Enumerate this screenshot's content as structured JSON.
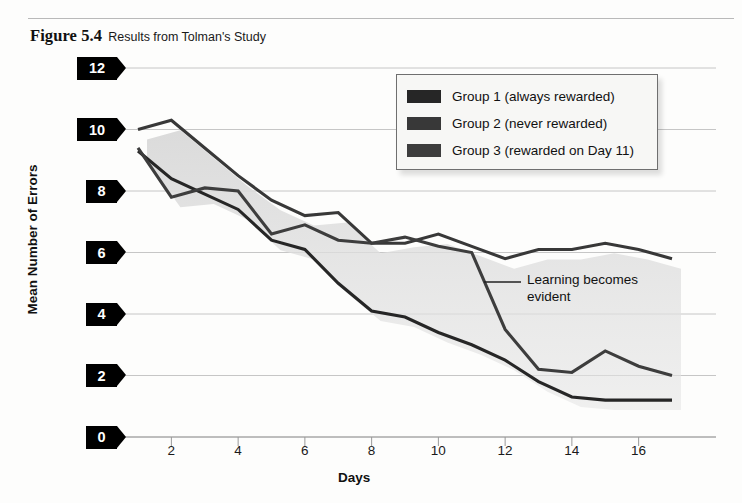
{
  "figure": {
    "number": "Figure 5.4",
    "title": "Results from Tolman's Study"
  },
  "annotation": {
    "text": "Learning becomes\nevident"
  },
  "legend": {
    "items": [
      {
        "label": "Group 1 (always rewarded)",
        "color": "#262626"
      },
      {
        "label": "Group 2 (never rewarded)",
        "color": "#383838"
      },
      {
        "label": "Group 3 (rewarded on Day 11)",
        "color": "#3d3d3d"
      }
    ]
  },
  "chart_data": {
    "type": "line",
    "title": "Results from Tolman's Study",
    "xlabel": "Days",
    "ylabel": "Mean Number of Errors",
    "xlim": [
      1,
      17
    ],
    "ylim": [
      0,
      12
    ],
    "xticks": [
      2,
      4,
      6,
      8,
      10,
      12,
      14,
      16
    ],
    "yticks": [
      0,
      2,
      4,
      6,
      8,
      10,
      12
    ],
    "grid": true,
    "legend_position": "top-right",
    "x": [
      1,
      2,
      3,
      4,
      5,
      6,
      7,
      8,
      9,
      10,
      11,
      12,
      13,
      14,
      15,
      16,
      17
    ],
    "series": [
      {
        "name": "Group 1 (always rewarded)",
        "color": "#262626",
        "values": [
          9.3,
          8.4,
          7.9,
          7.4,
          6.4,
          6.1,
          5.0,
          4.1,
          3.9,
          3.4,
          3.0,
          2.5,
          1.8,
          1.3,
          1.2,
          1.2,
          1.2
        ]
      },
      {
        "name": "Group 2 (never rewarded)",
        "color": "#383838",
        "values": [
          10.0,
          10.3,
          9.4,
          8.5,
          7.7,
          7.2,
          7.3,
          6.3,
          6.3,
          6.6,
          6.2,
          5.8,
          6.1,
          6.1,
          6.3,
          6.1,
          5.8
        ]
      },
      {
        "name": "Group 3 (rewarded on Day 11)",
        "color": "#3d3d3d",
        "values": [
          9.4,
          7.8,
          8.1,
          8.0,
          6.6,
          6.9,
          6.4,
          6.3,
          6.5,
          6.2,
          6.0,
          3.5,
          2.2,
          2.1,
          2.8,
          2.3,
          2.0
        ]
      }
    ],
    "annotations": [
      {
        "text": "Learning becomes evident",
        "points_to_day": 12
      }
    ]
  }
}
